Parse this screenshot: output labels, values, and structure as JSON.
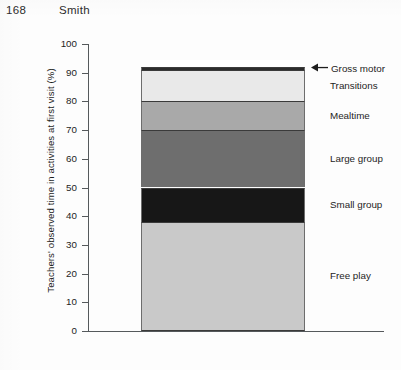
{
  "runhead": {
    "folio": "168",
    "author": "Smith"
  },
  "chart_data": {
    "type": "bar",
    "subtype": "stacked-bar-single-column",
    "title": "",
    "xlabel": "",
    "ylabel": "Teachers' observed time in activities at first visit (%)",
    "ylim": [
      0,
      100
    ],
    "ytick_labels": [
      "0",
      "10",
      "20",
      "30",
      "40",
      "50",
      "60",
      "70",
      "80",
      "90",
      "100"
    ],
    "ytick_values": [
      0,
      10,
      20,
      30,
      40,
      50,
      60,
      70,
      80,
      90,
      100
    ],
    "grid": false,
    "legend_position": "right-inline-labels",
    "categories": [
      "First visit"
    ],
    "series": [
      {
        "name": "Free play",
        "values": [
          38
        ],
        "start": 0,
        "end": 38,
        "color": "#c9c9c9"
      },
      {
        "name": "Small group",
        "values": [
          12
        ],
        "start": 38,
        "end": 50,
        "color": "#171717"
      },
      {
        "name": "Large group",
        "values": [
          20
        ],
        "start": 50,
        "end": 70,
        "color": "#6e6e6e"
      },
      {
        "name": "Mealtime",
        "values": [
          10
        ],
        "start": 70,
        "end": 80,
        "color": "#a9a9a9"
      },
      {
        "name": "Transitions",
        "values": [
          11
        ],
        "start": 80,
        "end": 91,
        "color": "#e9e9e9"
      },
      {
        "name": "Gross motor",
        "values": [
          1
        ],
        "start": 91,
        "end": 92,
        "color": "#2b2b2b"
      }
    ],
    "annotations": [
      {
        "text": "Gross motor",
        "icon": "left-arrow-icon",
        "points_to": "Gross motor"
      }
    ]
  }
}
